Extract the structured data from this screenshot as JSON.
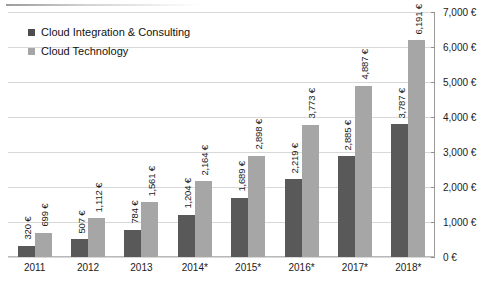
{
  "chart_data": {
    "type": "bar",
    "title": "",
    "xlabel": "",
    "ylabel": "",
    "categories": [
      "2011",
      "2012",
      "2013",
      "2014*",
      "2015*",
      "2016*",
      "2017*",
      "2018*"
    ],
    "series": [
      {
        "name": "Cloud Integration & Consulting",
        "color": "#595959",
        "values": [
          320,
          507,
          784,
          1204,
          1689,
          2219,
          2885,
          3787
        ],
        "labels": [
          "320 €",
          "507 €",
          "784 €",
          "1,204 €",
          "1,689 €",
          "2,219 €",
          "2,885 €",
          "3,787 €"
        ]
      },
      {
        "name": "Cloud Technology",
        "color": "#a6a6a6",
        "values": [
          699,
          1112,
          1561,
          2164,
          2898,
          3773,
          4887,
          6191
        ],
        "labels": [
          "699 €",
          "1,112 €",
          "1,561 €",
          "2,164 €",
          "2,898 €",
          "3,773 €",
          "4,887 €",
          "6,191 €"
        ]
      }
    ],
    "ylim": [
      0,
      7000
    ],
    "ytick_values": [
      0,
      1000,
      2000,
      3000,
      4000,
      5000,
      6000,
      7000
    ],
    "ytick_labels": [
      "0 €",
      "1,000 €",
      "2,000 €",
      "3,000 €",
      "4,000 €",
      "5,000 €",
      "6,000 €",
      "7,000 €"
    ],
    "grid": true,
    "legend_position": "top-left",
    "axis_position": "right",
    "data_labels_rotation": -90
  },
  "legend": {
    "items": [
      {
        "label": "Cloud Integration & Consulting",
        "swatch": "legend-swatch-dark"
      },
      {
        "label": "Cloud Technology",
        "swatch": "legend-swatch-light"
      }
    ]
  }
}
